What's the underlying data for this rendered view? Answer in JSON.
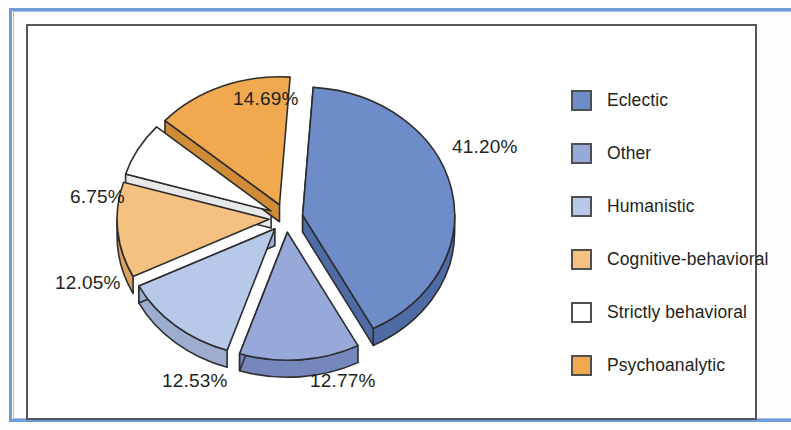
{
  "chart_data": {
    "type": "pie",
    "title": "",
    "subtitle": "",
    "xlabel": "",
    "ylabel": "",
    "exploded": true,
    "three_d": true,
    "legend_position": "right",
    "grid": false,
    "categories": [
      "Eclectic",
      "Other",
      "Humanistic",
      "Cognitive-behavioral",
      "Strictly behavioral",
      "Psychoanalytic"
    ],
    "values": [
      41.2,
      12.77,
      12.53,
      12.05,
      6.75,
      14.69
    ],
    "value_labels": [
      "41.20%",
      "12.77%",
      "12.53%",
      "12.05%",
      "6.75%",
      "14.69%"
    ],
    "colors": [
      "#6e8dc8",
      "#96a9d8",
      "#b8c8e8",
      "#f5c180",
      "#ffffff",
      "#f0a94e"
    ],
    "slices": [
      {
        "label": "Eclectic",
        "value": 41.2,
        "value_label": "41.20%",
        "color": "#6e8dc8",
        "side_color": "#4e6ba6"
      },
      {
        "label": "Other",
        "value": 12.77,
        "value_label": "12.77%",
        "color": "#96a9d8",
        "side_color": "#7688bb"
      },
      {
        "label": "Humanistic",
        "value": 12.53,
        "value_label": "12.53%",
        "color": "#b8c8e8",
        "side_color": "#9cadd0"
      },
      {
        "label": "Cognitive-behavioral",
        "value": 12.05,
        "value_label": "12.05%",
        "color": "#f5c180",
        "side_color": "#d9a25c"
      },
      {
        "label": "Strictly behavioral",
        "value": 6.75,
        "value_label": "6.75%",
        "color": "#ffffff",
        "side_color": "#e8e8e8"
      },
      {
        "label": "Psychoanalytic",
        "value": 14.69,
        "value_label": "14.69%",
        "color": "#f0a94e",
        "side_color": "#cf8b35"
      }
    ]
  },
  "legend": {
    "items": [
      {
        "label": "Eclectic",
        "color": "#6e8dc8"
      },
      {
        "label": "Other",
        "color": "#96a9d8"
      },
      {
        "label": "Humanistic",
        "color": "#b8c8e8"
      },
      {
        "label": "Cognitive-behavioral",
        "color": "#f5c180"
      },
      {
        "label": "Strictly behavioral",
        "color": "#ffffff"
      },
      {
        "label": "Psychoanalytic",
        "color": "#f0a94e"
      }
    ]
  },
  "callouts": [
    {
      "text": "41.20%",
      "x": 424,
      "y": 110
    },
    {
      "text": "14.69%",
      "x": 205,
      "y": 62
    },
    {
      "text": "6.75%",
      "x": 42,
      "y": 160
    },
    {
      "text": "12.05%",
      "x": 27,
      "y": 246
    },
    {
      "text": "12.53%",
      "x": 134,
      "y": 344
    },
    {
      "text": "12.77%",
      "x": 282,
      "y": 344
    }
  ],
  "frame": {
    "outer_border_color": "#6f9bd8",
    "inner_border_color": "#55565a",
    "background": "#ffffff"
  }
}
